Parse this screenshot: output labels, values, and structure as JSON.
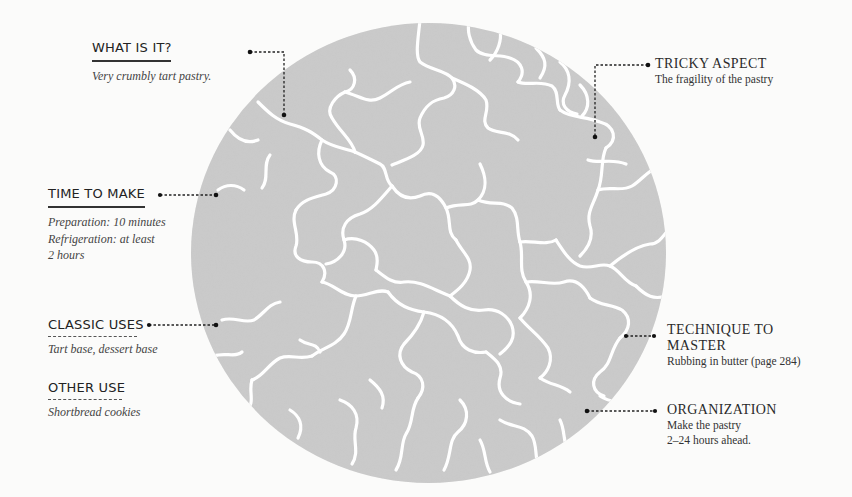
{
  "illustration": {
    "name": "crumbly tart pastry disc",
    "fill_color": "#cbcbcb",
    "crack_color": "#ffffff",
    "connector_color": "#222222"
  },
  "left": {
    "what_is_it": {
      "heading": "WHAT IS IT?",
      "text": "Very crumbly tart pastry."
    },
    "time_to_make": {
      "heading": "TIME TO MAKE",
      "lines": [
        "Preparation: 10 minutes",
        "Refrigeration: at least",
        "2 hours"
      ]
    },
    "classic_uses": {
      "heading": "CLASSIC USES",
      "text": "Tart base, dessert base"
    },
    "other_use": {
      "heading": "OTHER USE",
      "text": "Shortbread cookies"
    }
  },
  "right": {
    "tricky_aspect": {
      "heading": "TRICKY ASPECT",
      "text": "The fragility of the pastry"
    },
    "technique": {
      "heading_lines": [
        "TECHNIQUE TO",
        "MASTER"
      ],
      "text": "Rubbing in butter (page 284)"
    },
    "organization": {
      "heading": "ORGANIZATION",
      "lines": [
        "Make the pastry",
        "2–24 hours ahead."
      ]
    }
  }
}
